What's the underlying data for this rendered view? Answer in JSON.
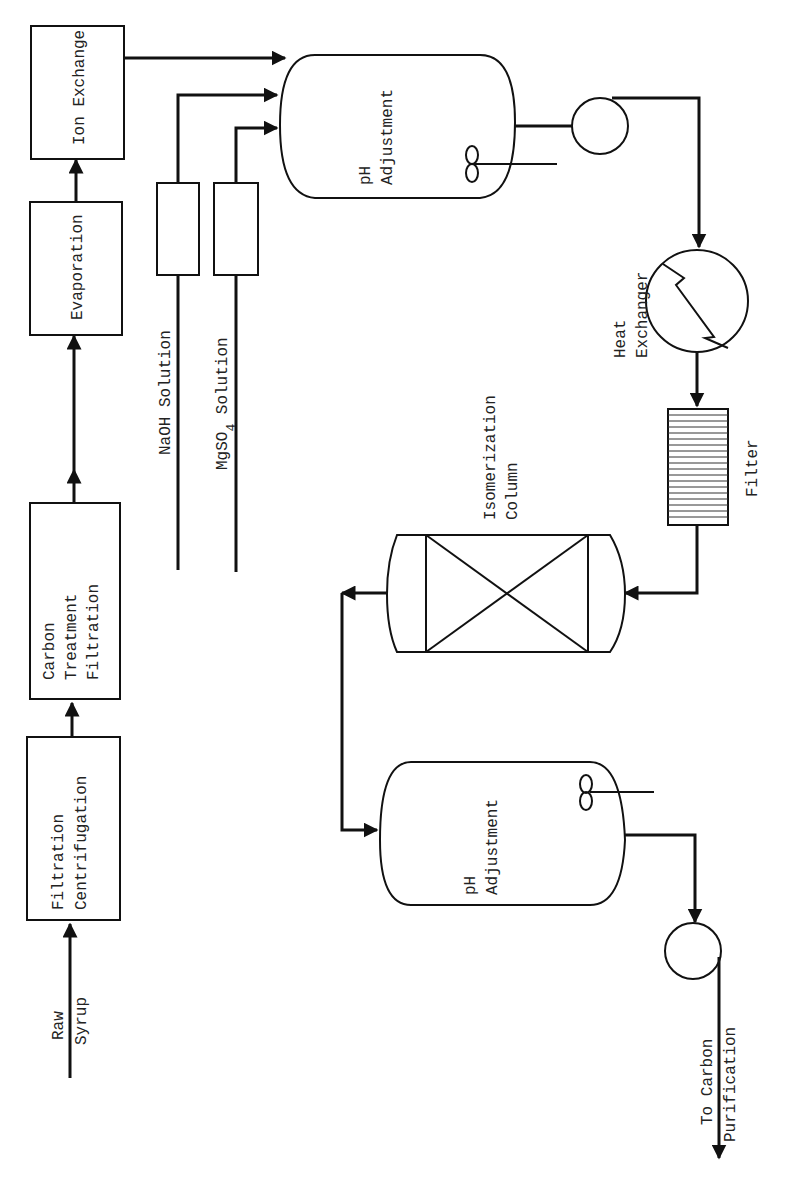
{
  "diagram": {
    "type": "process-flow",
    "orientation": "rotated-90-ccw",
    "blocks": [
      {
        "id": "filtration_centrifugation",
        "lines": [
          "Filtration",
          "Centrifugation"
        ]
      },
      {
        "id": "carbon_treatment",
        "lines": [
          "Carbon",
          "Treatment",
          "Filtration"
        ]
      },
      {
        "id": "evaporation",
        "lines": [
          "Evaporation"
        ]
      },
      {
        "id": "ion_exchange",
        "lines": [
          "Ion Exchange"
        ]
      }
    ],
    "inputs": {
      "raw_syrup": [
        "Raw",
        "Syrup"
      ],
      "naoh": "NaOH Solution",
      "mgso4_main": "MgSO",
      "mgso4_sub": "4",
      "mgso4_tail": " Solution"
    },
    "vessels": {
      "ph1": [
        "pH",
        "Adjustment"
      ],
      "ph2": [
        "pH",
        "Adjustment"
      ],
      "heat_exchanger": [
        "Heat",
        "Exchanger"
      ],
      "filter": "Filter",
      "isomerization": [
        "Isomerization",
        "Column"
      ]
    },
    "output": [
      "To Carbon",
      "Purification"
    ]
  }
}
